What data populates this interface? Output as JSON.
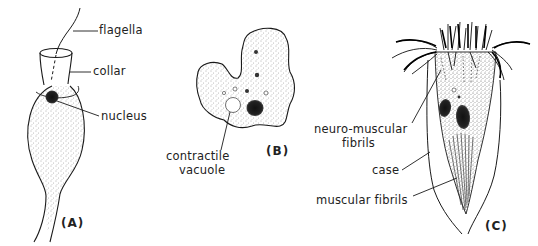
{
  "figure": {
    "panels": [
      {
        "id": "A",
        "panel_label": "(A)",
        "organism_shape": "flask-shaped cell with collar and single flagellum",
        "labels": {
          "flagella": "flagella",
          "collar": "collar",
          "nucleus": "nucleus"
        }
      },
      {
        "id": "B",
        "panel_label": "(B)",
        "organism_shape": "irregular amoeboid cell",
        "labels": {
          "contractile_vacuole_line1": "contractile",
          "contractile_vacuole_line2": "vacuole"
        }
      },
      {
        "id": "C",
        "panel_label": "(C)",
        "organism_shape": "ciliate within a conical case with crown of cilia",
        "labels": {
          "neuro_muscular_line1": "neuro-muscular",
          "neuro_muscular_line2": "fibrils",
          "case": "case",
          "muscular_fibrils": "muscular fibrils"
        }
      }
    ],
    "colors": {
      "ink": "#1a1a1a",
      "stipple": "#555555",
      "background": "#ffffff"
    }
  }
}
